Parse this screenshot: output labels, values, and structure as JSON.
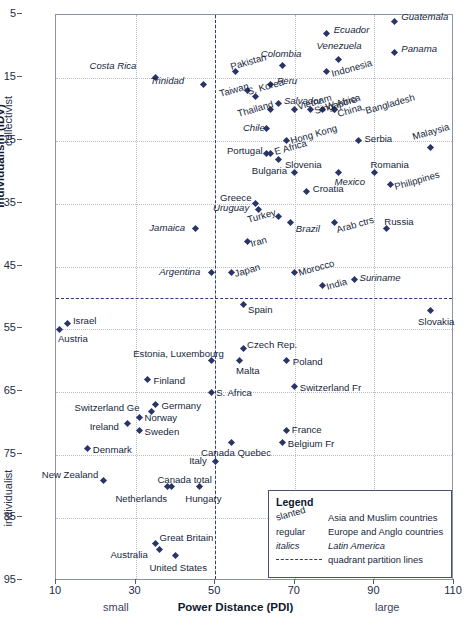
{
  "chart_data": {
    "type": "scatter",
    "title": "",
    "xlabel": "Power Distance (PDI)",
    "ylabel": "Individualism (IDV)",
    "xlim": [
      10,
      110
    ],
    "ylim": [
      5,
      95
    ],
    "y_inverted": true,
    "xticks": [
      10,
      30,
      50,
      70,
      90,
      110
    ],
    "yticks": [
      5,
      15,
      25,
      35,
      45,
      55,
      65,
      75,
      85,
      95
    ],
    "x_notes": {
      "low": "small",
      "high": "large"
    },
    "y_notes": {
      "low": "collectivist",
      "high": "individualist"
    },
    "grid": true,
    "quadrant_lines": {
      "x": 50,
      "y": 50
    },
    "points": [
      {
        "name": "Costa Rica",
        "x": 35,
        "y": 15,
        "style": "ital",
        "lx": -66,
        "ly": -13
      },
      {
        "name": "Trinidad",
        "x": 47,
        "y": 16,
        "style": "ital",
        "lx": -53,
        "ly": -4
      },
      {
        "name": "Guatemala",
        "x": 95,
        "y": 6,
        "style": "ital",
        "lx": 7,
        "ly": -5
      },
      {
        "name": "Panama",
        "x": 95,
        "y": 11,
        "style": "ital",
        "lx": 7,
        "ly": -5
      },
      {
        "name": "Ecuador",
        "x": 78,
        "y": 8,
        "style": "ital",
        "lx": 7,
        "ly": -5
      },
      {
        "name": "Venezuela",
        "x": 81,
        "y": 12,
        "style": "ital",
        "lx": -22,
        "ly": -14
      },
      {
        "name": "Indonesia",
        "x": 78,
        "y": 14,
        "style": "slant",
        "lx": 6,
        "ly": 1
      },
      {
        "name": "Pakistan",
        "x": 55,
        "y": 14,
        "style": "slant",
        "lx": -3,
        "ly": -6
      },
      {
        "name": "Colombia",
        "x": 67,
        "y": 13,
        "style": "ital",
        "lx": -22,
        "ly": -12
      },
      {
        "name": "S. Korea",
        "x": 60,
        "y": 18,
        "style": "slant",
        "lx": -6,
        "ly": -6
      },
      {
        "name": "Peru",
        "x": 64,
        "y": 16,
        "style": "ital",
        "lx": 6,
        "ly": -4
      },
      {
        "name": "Taiwan",
        "x": 58,
        "y": 17,
        "style": "slant",
        "lx": -26,
        "ly": 3
      },
      {
        "name": "Salvador",
        "x": 66,
        "y": 19,
        "style": "ital",
        "lx": 5,
        "ly": -3
      },
      {
        "name": "Thailand",
        "x": 64,
        "y": 20,
        "style": "slant",
        "lx": -32,
        "ly": 4
      },
      {
        "name": "Vietnam",
        "x": 70,
        "y": 20,
        "style": "slant",
        "lx": 4,
        "ly": -3
      },
      {
        "name": "W Africa",
        "x": 77,
        "y": 20,
        "style": "slant",
        "lx": 4,
        "ly": -3
      },
      {
        "name": "China,",
        "x": 80,
        "y": 20,
        "style": "slant",
        "lx": 4,
        "ly": 4
      },
      {
        "name": "Bangladesh",
        "x": 80,
        "y": 20,
        "style": "slant",
        "lx": 32,
        "ly": 1
      },
      {
        "name": "Chile",
        "x": 63,
        "y": 23,
        "style": "ital",
        "lx": -24,
        "ly": -1
      },
      {
        "name": "Singapore",
        "x": 74,
        "y": 20,
        "style": "slant",
        "lx": 5,
        "ly": 1
      },
      {
        "name": "Hong Kong",
        "x": 68,
        "y": 25,
        "style": "slant",
        "lx": 5,
        "ly": -1
      },
      {
        "name": "Serbia",
        "x": 86,
        "y": 25,
        "style": "regular",
        "lx": 6,
        "ly": -3
      },
      {
        "name": "Malaysia",
        "x": 104,
        "y": 26,
        "style": "slant",
        "lx": -16,
        "ly": -11
      },
      {
        "name": "Portugal",
        "x": 63,
        "y": 27,
        "style": "regular",
        "lx": -40,
        "ly": -3
      },
      {
        "name": "E Africa",
        "x": 64,
        "y": 27,
        "style": "slant",
        "lx": 5,
        "ly": -2
      },
      {
        "name": "Slovenia",
        "x": 66,
        "y": 28,
        "style": "regular",
        "lx": 6,
        "ly": 4
      },
      {
        "name": "Romania",
        "x": 90,
        "y": 30,
        "style": "regular",
        "lx": -4,
        "ly": -8
      },
      {
        "name": "Philippines",
        "x": 94,
        "y": 32,
        "style": "slant",
        "lx": 6,
        "ly": 1
      },
      {
        "name": "Bulgaria",
        "x": 70,
        "y": 30,
        "style": "regular",
        "lx": -43,
        "ly": -2
      },
      {
        "name": "Mexico",
        "x": 81,
        "y": 30,
        "style": "ital",
        "lx": -4,
        "ly": 9
      },
      {
        "name": "Croatia",
        "x": 73,
        "y": 33,
        "style": "regular",
        "lx": 6,
        "ly": -3
      },
      {
        "name": "Greece",
        "x": 60,
        "y": 35,
        "style": "regular",
        "lx": -35,
        "ly": -7
      },
      {
        "name": "Uruguay",
        "x": 61,
        "y": 36,
        "style": "ital",
        "lx": -46,
        "ly": -3
      },
      {
        "name": "Turkey",
        "x": 66,
        "y": 37,
        "style": "slant",
        "lx": -30,
        "ly": 3
      },
      {
        "name": "Brazil",
        "x": 69,
        "y": 38,
        "style": "ital",
        "lx": 5,
        "ly": 5
      },
      {
        "name": "Arab ctrs",
        "x": 80,
        "y": 38,
        "style": "slant",
        "lx": 3,
        "ly": 6
      },
      {
        "name": "Russia",
        "x": 93,
        "y": 39,
        "style": "regular",
        "lx": -2,
        "ly": -8
      },
      {
        "name": "Jamaica",
        "x": 45,
        "y": 39,
        "style": "ital",
        "lx": -46,
        "ly": -2
      },
      {
        "name": "Iran",
        "x": 58,
        "y": 41,
        "style": "slant",
        "lx": 5,
        "ly": 2
      },
      {
        "name": "Argentina",
        "x": 49,
        "y": 46,
        "style": "ital",
        "lx": -52,
        "ly": -2
      },
      {
        "name": "Japan",
        "x": 54,
        "y": 46,
        "style": "slant",
        "lx": 5,
        "ly": 0
      },
      {
        "name": "Morocco",
        "x": 70,
        "y": 46,
        "style": "slant",
        "lx": 5,
        "ly": -1
      },
      {
        "name": "India",
        "x": 77,
        "y": 48,
        "style": "slant",
        "lx": 5,
        "ly": 1
      },
      {
        "name": "Suriname",
        "x": 85,
        "y": 47,
        "style": "ital",
        "lx": 5,
        "ly": -2
      },
      {
        "name": "Spain",
        "x": 57,
        "y": 51,
        "style": "regular",
        "lx": 5,
        "ly": 5
      },
      {
        "name": "Slovakia",
        "x": 104,
        "y": 52,
        "style": "regular",
        "lx": -12,
        "ly": 10
      },
      {
        "name": "Israel",
        "x": 13,
        "y": 54,
        "style": "regular",
        "lx": 5,
        "ly": -3
      },
      {
        "name": "Austria",
        "x": 11,
        "y": 55,
        "style": "regular",
        "lx": -2,
        "ly": 9
      },
      {
        "name": "Estonia, Luxembourg",
        "x": 49,
        "y": 60,
        "style": "regular",
        "lx": -78,
        "ly": -8
      },
      {
        "name": "Czech Rep.",
        "x": 57,
        "y": 58,
        "style": "regular",
        "lx": 4,
        "ly": -4
      },
      {
        "name": "Malta",
        "x": 56,
        "y": 60,
        "style": "regular",
        "lx": -3,
        "ly": 9
      },
      {
        "name": "Poland",
        "x": 68,
        "y": 60,
        "style": "regular",
        "lx": 6,
        "ly": 0
      },
      {
        "name": "Finland",
        "x": 33,
        "y": 63,
        "style": "regular",
        "lx": 6,
        "ly": 0
      },
      {
        "name": "S. Africa",
        "x": 49,
        "y": 65,
        "style": "regular",
        "lx": 5,
        "ly": 0
      },
      {
        "name": "Switzerland Fr",
        "x": 70,
        "y": 64,
        "style": "regular",
        "lx": 5,
        "ly": 1
      },
      {
        "name": "Germany",
        "x": 35,
        "y": 67,
        "style": "regular",
        "lx": 6,
        "ly": 0
      },
      {
        "name": "Switzerland Ge",
        "x": 34,
        "y": 68,
        "style": "regular",
        "lx": -77,
        "ly": -4
      },
      {
        "name": "Norway",
        "x": 31,
        "y": 69,
        "style": "regular",
        "lx": 5,
        "ly": 0
      },
      {
        "name": "Ireland",
        "x": 28,
        "y": 70,
        "style": "regular",
        "lx": -38,
        "ly": 2
      },
      {
        "name": "Sweden",
        "x": 31,
        "y": 71,
        "style": "regular",
        "lx": 5,
        "ly": 1
      },
      {
        "name": "France",
        "x": 68,
        "y": 71,
        "style": "regular",
        "lx": 5,
        "ly": -1
      },
      {
        "name": "Belgium Fr",
        "x": 67,
        "y": 73,
        "style": "regular",
        "lx": 5,
        "ly": 0
      },
      {
        "name": "Canada Quebec",
        "x": 54,
        "y": 73,
        "style": "regular",
        "lx": -30,
        "ly": 9
      },
      {
        "name": "Denmark",
        "x": 18,
        "y": 74,
        "style": "regular",
        "lx": 5,
        "ly": 0
      },
      {
        "name": "Italy",
        "x": 50,
        "y": 76,
        "style": "regular",
        "lx": -26,
        "ly": -2
      },
      {
        "name": "Canada total",
        "x": 39,
        "y": 80,
        "style": "regular",
        "lx": -14,
        "ly": -8
      },
      {
        "name": "Netherlands",
        "x": 38,
        "y": 80,
        "style": "regular",
        "lx": -52,
        "ly": 11
      },
      {
        "name": "Hungary",
        "x": 46,
        "y": 80,
        "style": "regular",
        "lx": -14,
        "ly": 11
      },
      {
        "name": "New Zealand",
        "x": 22,
        "y": 79,
        "style": "regular",
        "lx": -62,
        "ly": -6
      },
      {
        "name": "Great Britain",
        "x": 35,
        "y": 89,
        "style": "regular",
        "lx": 4,
        "ly": -6
      },
      {
        "name": "Australia",
        "x": 36,
        "y": 90,
        "style": "regular",
        "lx": -49,
        "ly": 4
      },
      {
        "name": "United States",
        "x": 40,
        "y": 91,
        "style": "regular",
        "lx": -26,
        "ly": 11
      }
    ]
  },
  "legend": {
    "title": "Legend",
    "rows": [
      {
        "key": "slanted",
        "key_style": "slant",
        "value": "Asia and Muslim countries",
        "value_style": "regular"
      },
      {
        "key": "regular",
        "key_style": "regular",
        "value": "Europe and Anglo countries",
        "value_style": "regular"
      },
      {
        "key": "italics",
        "key_style": "ital",
        "value": "Latin America",
        "value_style": "ital"
      },
      {
        "key": "",
        "key_style": "line",
        "value": "quadrant partition lines",
        "value_style": "regular"
      }
    ]
  },
  "colors": {
    "point": "#2a3566",
    "quadrant": "#2b3a78",
    "frame": "#8d93a6",
    "grid": "#b9bdc9"
  }
}
